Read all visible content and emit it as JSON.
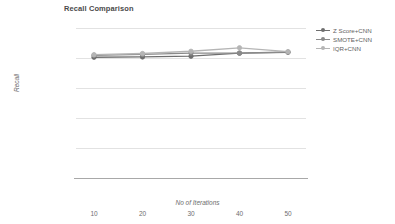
{
  "chart_data": {
    "type": "line",
    "title": "Recall Comparison",
    "xlabel": "No of Iterations",
    "ylabel": "Recall",
    "categories": [
      10,
      20,
      30,
      40,
      50
    ],
    "x": [
      10,
      20,
      30,
      40,
      50
    ],
    "xtick_labels": [
      "10",
      "20",
      "30",
      "40",
      "50"
    ],
    "ytick_labels": [
      "1",
      "0.8",
      "0.6",
      "0.4",
      "0.2",
      "0"
    ],
    "yticks": [
      1,
      0.8,
      0.6,
      0.4,
      0.2,
      0
    ],
    "ylim": [
      0,
      1
    ],
    "grid": true,
    "legend_position": "right",
    "series": [
      {
        "name": "Z Score+CNN",
        "color": "#6e6e6e",
        "marker": "circle",
        "values": [
          0.805,
          0.807,
          0.812,
          0.832,
          0.838
        ]
      },
      {
        "name": "SMOTE+CNN",
        "color": "#8a8a8a",
        "marker": "circle",
        "values": [
          0.818,
          0.824,
          0.833,
          0.833,
          0.84
        ]
      },
      {
        "name": "IQR+CNN",
        "color": "#b5b5b5",
        "marker": "circle",
        "values": [
          0.822,
          0.83,
          0.845,
          0.868,
          0.842
        ]
      }
    ]
  },
  "legend": {
    "items": [
      {
        "label": "Z Score+CNN"
      },
      {
        "label": "SMOTE+CNN"
      },
      {
        "label": "IQR+CNN"
      }
    ]
  },
  "colors": {
    "gridline": "#e2e2e2",
    "axis": "#a8a8a8",
    "title_text": "#4a4a4a",
    "tick_text": "#6e6e6e"
  }
}
